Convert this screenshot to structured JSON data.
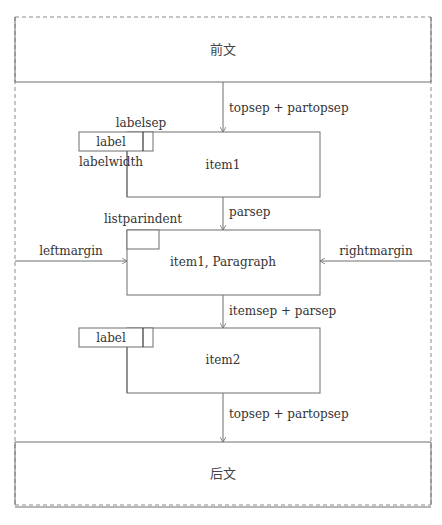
{
  "diagram": {
    "before_text": "前文",
    "after_text": "后文",
    "labels": {
      "topsep_top": "topsep + partopsep",
      "labelsep": "labelsep",
      "label1": "label",
      "labelwidth": "labelwidth",
      "item1": "item1",
      "parsep": "parsep",
      "listparindent": "listparindent",
      "leftmargin": "leftmargin",
      "paragraph": "item1, Paragraph",
      "rightmargin": "rightmargin",
      "itemsep_parsep": "itemsep + parsep",
      "label2": "label",
      "item2": "item2",
      "topsep_bottom": "topsep + partopsep"
    },
    "colors": {
      "line": "#6e6e6e",
      "text": "#333333",
      "dash": "#8a8a8a"
    }
  }
}
